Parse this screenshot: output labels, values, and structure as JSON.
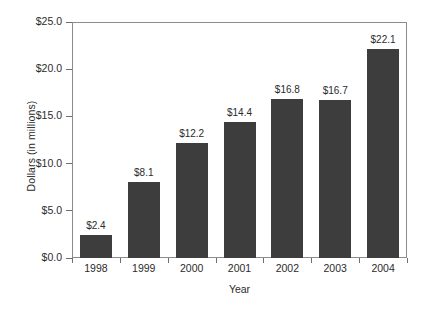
{
  "chart_data": {
    "type": "bar",
    "title": "",
    "subtitle": "",
    "xlabel": "Year",
    "ylabel": "Dollars (in millions)",
    "categories": [
      "1998",
      "1999",
      "2000",
      "2001",
      "2002",
      "2003",
      "2004"
    ],
    "values": [
      2.4,
      8.1,
      12.2,
      14.4,
      16.8,
      16.7,
      22.1
    ],
    "data_labels": [
      "$2.4",
      "$8.1",
      "$12.2",
      "$14.4",
      "$16.8",
      "$16.7",
      "$22.1"
    ],
    "ylim": [
      0,
      25
    ],
    "ytick_values": [
      0,
      5,
      10,
      15,
      20,
      25
    ],
    "ytick_labels": [
      "$0.0",
      "$5.0",
      "$10.0",
      "$15.0",
      "$20.0",
      "$25.0"
    ],
    "grid": false,
    "legend": null,
    "bar_color": "#3d3d3d",
    "plot_border_color": "#8c8c8c",
    "background_color": "#ffffff",
    "text_color": "#2b2b2b"
  }
}
